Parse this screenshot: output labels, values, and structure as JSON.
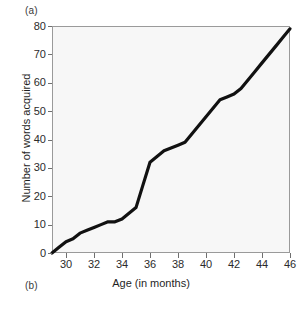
{
  "figure": {
    "panel_label_a": "(a)",
    "panel_label_b": "(b)"
  },
  "colors": {
    "line": "#111111",
    "plot_background": "#f7f7f7",
    "axis": "#9a9a9a",
    "tick": "#6f6f6f",
    "text": "#222222"
  },
  "chart_data": {
    "type": "line",
    "title": "",
    "subtitle": "",
    "xlabel": "Age (in months)",
    "ylabel": "Number of words acquired",
    "xlim": [
      29,
      46
    ],
    "ylim": [
      0,
      80
    ],
    "xticks": [
      30,
      32,
      34,
      36,
      38,
      40,
      42,
      44,
      46
    ],
    "xtick_labels": [
      "30",
      "32",
      "34",
      "36",
      "38",
      "40",
      "42",
      "44",
      "46"
    ],
    "yticks": [
      0,
      10,
      20,
      30,
      40,
      50,
      60,
      70,
      80
    ],
    "ytick_labels": [
      "0",
      "10",
      "20",
      "30",
      "40",
      "50",
      "60",
      "70",
      "80"
    ],
    "grid": false,
    "legend": null,
    "legend_position": "none",
    "annotations": [],
    "series": [
      {
        "name": "Cumulative words acquired",
        "x": [
          29.0,
          29.5,
          30.0,
          30.5,
          31.0,
          31.5,
          32.0,
          32.5,
          33.0,
          33.5,
          34.0,
          34.5,
          35.0,
          35.5,
          36.0,
          36.5,
          37.0,
          37.5,
          38.0,
          38.5,
          39.0,
          39.5,
          40.0,
          40.5,
          41.0,
          41.5,
          42.0,
          42.5,
          43.0,
          43.5,
          44.0,
          44.5,
          45.0,
          45.5,
          46.0
        ],
        "y": [
          0,
          2,
          4,
          5,
          7,
          8,
          9,
          10,
          11,
          11,
          12,
          14,
          16,
          24,
          32,
          34,
          36,
          37,
          38,
          39,
          42,
          45,
          48,
          51,
          54,
          55,
          56,
          58,
          61,
          64,
          67,
          70,
          73,
          76,
          79
        ]
      }
    ]
  }
}
